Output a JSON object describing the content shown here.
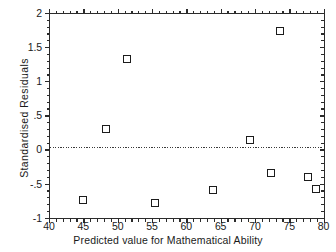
{
  "chart_data": {
    "type": "scatter",
    "title": "",
    "xlabel": "Predicted value for Mathematical Ability",
    "ylabel": "Standardised  Residuals",
    "xlim": [
      40,
      80
    ],
    "ylim": [
      -1,
      2
    ],
    "grid": false,
    "legend": null,
    "reference_line": {
      "axis": "y",
      "value": 0,
      "style": "dotted"
    },
    "xticks": [
      40,
      45,
      50,
      55,
      60,
      65,
      70,
      75,
      80
    ],
    "xtick_labels": [
      "40",
      "45",
      "50",
      "55",
      "60",
      "65",
      "70",
      "75",
      "80"
    ],
    "yticks": [
      -1,
      -0.5,
      0,
      0.5,
      1,
      1.5,
      2
    ],
    "ytick_labels": [
      "-1",
      "-.5",
      "0",
      ".5",
      "1",
      "1.5",
      "2"
    ],
    "x_minor_step": 1,
    "y_minor_step": 0.1,
    "points": [
      {
        "x": 45.0,
        "y": -0.74
      },
      {
        "x": 48.3,
        "y": 0.3
      },
      {
        "x": 51.4,
        "y": 1.32
      },
      {
        "x": 55.4,
        "y": -0.79
      },
      {
        "x": 63.9,
        "y": -0.6
      },
      {
        "x": 69.3,
        "y": 0.14
      },
      {
        "x": 72.3,
        "y": -0.35
      },
      {
        "x": 73.6,
        "y": 1.74
      },
      {
        "x": 77.7,
        "y": -0.41
      },
      {
        "x": 78.9,
        "y": -0.58
      }
    ],
    "marker": {
      "shape": "square-open",
      "edge_color": "#1c1c1c",
      "face_color": "#ffffff",
      "size_px": 8
    },
    "axes_color": "#2b2b2b",
    "background_color": "#ffffff"
  }
}
